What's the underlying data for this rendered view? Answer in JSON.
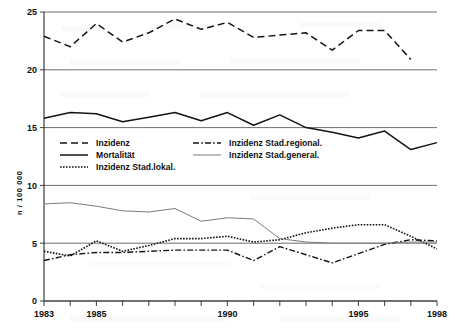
{
  "chart_data": {
    "type": "line",
    "title": "",
    "xlabel": "",
    "ylabel": "n / 100 000",
    "xlim": [
      1983,
      1998
    ],
    "ylim": [
      0,
      25
    ],
    "ytick_values": [
      0,
      5,
      10,
      15,
      20,
      25
    ],
    "ytick_labels": [
      "0",
      "5",
      "10",
      "15",
      "20",
      "25"
    ],
    "xtick_values": [
      1983,
      1984,
      1985,
      1986,
      1987,
      1988,
      1989,
      1990,
      1991,
      1992,
      1993,
      1994,
      1995,
      1996,
      1997,
      1998
    ],
    "xtick_labels_shown": [
      "1983",
      "1985",
      "1990",
      "1995",
      "1998"
    ],
    "xtick_labels_shown_values": [
      1983,
      1985,
      1990,
      1995,
      1998
    ],
    "grid": "horizontal",
    "legend_position": "inside-center-left",
    "x": [
      1983,
      1984,
      1985,
      1986,
      1987,
      1988,
      1989,
      1990,
      1991,
      1992,
      1993,
      1994,
      1995,
      1996,
      1997,
      1998
    ],
    "series": [
      {
        "name": "Inzidenz",
        "style": "dashed",
        "color": "#141414",
        "width": 1.5,
        "dash": "7,4",
        "values": [
          22.9,
          22.0,
          24.0,
          22.4,
          23.2,
          24.4,
          23.5,
          24.1,
          22.8,
          23.0,
          23.2,
          21.7,
          23.4,
          23.4,
          20.9,
          null
        ]
      },
      {
        "name": "Mortalität",
        "style": "solid",
        "color": "#141414",
        "width": 1.5,
        "dash": "none",
        "values": [
          15.8,
          16.3,
          16.2,
          15.5,
          15.9,
          16.3,
          15.6,
          16.3,
          15.2,
          16.1,
          15.0,
          14.6,
          14.1,
          14.7,
          13.1,
          13.7
        ]
      },
      {
        "name": "Inzidenz Stad.lokal.",
        "style": "dotted",
        "color": "#141414",
        "width": 1.6,
        "dash": "1.6,1.4",
        "values": [
          4.3,
          3.9,
          5.2,
          4.3,
          4.8,
          5.4,
          5.4,
          5.6,
          5.1,
          5.3,
          5.9,
          6.3,
          6.6,
          6.6,
          5.6,
          4.5
        ]
      },
      {
        "name": "Inzidenz Stad.regional.",
        "style": "dashdot",
        "color": "#141414",
        "width": 1.4,
        "dash": "6,2.2,1.6,2.2",
        "values": [
          3.5,
          4.0,
          4.2,
          4.2,
          4.3,
          4.4,
          4.4,
          4.4,
          3.5,
          4.7,
          4.0,
          3.3,
          4.1,
          4.9,
          5.3,
          5.2
        ]
      },
      {
        "name": "Inzidenz Stad.general.",
        "style": "thin-solid",
        "color": "#7a7a7a",
        "width": 1.0,
        "dash": "none",
        "values": [
          8.4,
          8.5,
          8.2,
          7.8,
          7.7,
          8.0,
          6.9,
          7.2,
          7.1,
          5.4,
          5.1,
          5.0,
          5.0,
          5.0,
          5.1,
          5.1
        ]
      }
    ]
  },
  "legend": {
    "entries": [
      {
        "label": "Inzidenz",
        "style": "dashed",
        "column": 0
      },
      {
        "label": "Mortalität",
        "style": "solid",
        "column": 0
      },
      {
        "label": "Inzidenz Stad.lokal.",
        "style": "dotted",
        "column": 0
      },
      {
        "label": "Inzidenz Stad.regional.",
        "style": "dashdot",
        "column": 1
      },
      {
        "label": "Inzidenz Stad.general.",
        "style": "thin-solid",
        "column": 1
      }
    ]
  }
}
